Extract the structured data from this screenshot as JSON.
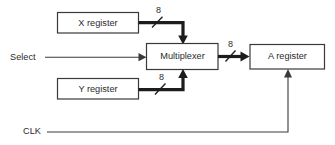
{
  "diagram": {
    "background_color": "#ffffff",
    "line_color": "#3a3a3a",
    "bus_color": "#1c1c1c",
    "text_color": "#2b2b2b",
    "blocks": [
      {
        "id": "x_register",
        "label": "X register"
      },
      {
        "id": "multiplexer",
        "label": "Multiplexer"
      },
      {
        "id": "y_register",
        "label": "Y register"
      },
      {
        "id": "a_register",
        "label": "A register"
      }
    ],
    "signals": [
      {
        "id": "select",
        "label": "Select"
      },
      {
        "id": "clk",
        "label": "CLK"
      }
    ],
    "bus_widths": [
      {
        "id": "x_to_mux_width",
        "label": "8"
      },
      {
        "id": "y_to_mux_width",
        "label": "8"
      },
      {
        "id": "mux_to_a_width",
        "label": "8"
      }
    ]
  }
}
